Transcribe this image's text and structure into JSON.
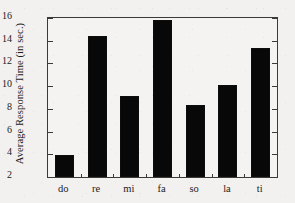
{
  "chart_data": {
    "type": "bar",
    "title": "",
    "xlabel": "",
    "ylabel": "Average Response Time (in sec.)",
    "categories": [
      "do",
      "re",
      "mi",
      "fa",
      "so",
      "la",
      "ti"
    ],
    "values": [
      3.9,
      14.4,
      9.1,
      15.8,
      8.3,
      10.1,
      13.4
    ],
    "ylim": [
      2,
      16
    ],
    "yticks": [
      2,
      4,
      6,
      8,
      10,
      12,
      14,
      16
    ],
    "ytick_labels": [
      "2",
      "4",
      "6",
      "8",
      "10",
      "12",
      "14",
      "16"
    ],
    "grid": false,
    "legend": null,
    "bar_color": "#080808",
    "frame_color": "#3a3a3a",
    "background_color": "#f2f1ef"
  }
}
